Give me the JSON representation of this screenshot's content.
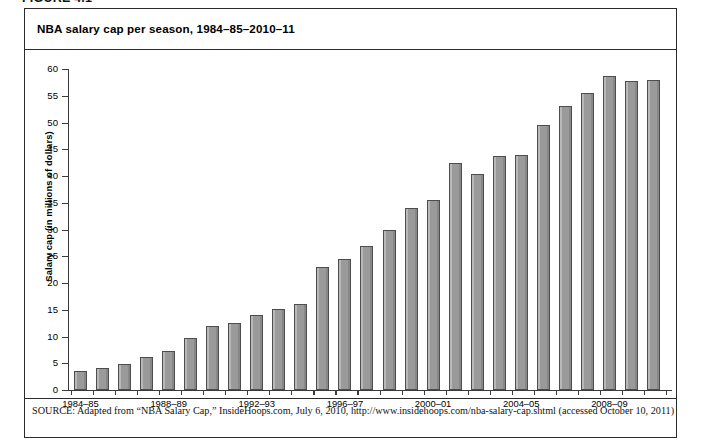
{
  "figure": {
    "label": "FIGURE 4.1"
  },
  "chart_title": "NBA salary cap per season, 1984–85–2010–11",
  "source": {
    "kicker": "SOURCE:",
    "text": " Adapted from “NBA Salary Cap,” InsideHoops.com, July 6, 2010, http://www.insidehoops.com/nba-salary-cap.shtml (accessed October 10, 2011)"
  },
  "chart_data": {
    "type": "bar",
    "title": "NBA salary cap per season, 1984–85–2010–11",
    "xlabel": "",
    "ylabel": "Salary cap (in millions of dollars)",
    "ylim": [
      0,
      60
    ],
    "ytick_step": 5,
    "yticks": [
      0,
      5,
      10,
      15,
      20,
      25,
      30,
      35,
      40,
      45,
      50,
      55,
      60
    ],
    "grid": false,
    "legend": false,
    "bar_color": "#919191",
    "bar_edge_color": "#4d4d4d",
    "categories": [
      "1984–85",
      "1985–86",
      "1986–87",
      "1987–88",
      "1988–89",
      "1989–90",
      "1990–91",
      "1991–92",
      "1992–93",
      "1993–94",
      "1994–95",
      "1995–96",
      "1996–97",
      "1997–98",
      "1998–99",
      "1999–00",
      "2000–01",
      "2001–02",
      "2002–03",
      "2003–04",
      "2004–05",
      "2005–06",
      "2006–07",
      "2007–08",
      "2008–09",
      "2009–10",
      "2010–11"
    ],
    "values": [
      3.6,
      4.2,
      4.9,
      6.2,
      7.2,
      9.8,
      11.9,
      12.5,
      14.0,
      15.2,
      16.0,
      23.0,
      24.4,
      26.9,
      30.0,
      34.0,
      35.5,
      42.5,
      40.3,
      43.8,
      43.9,
      49.5,
      53.1,
      55.6,
      58.7,
      57.7,
      58.0
    ],
    "xtick_labels": [
      "1984–85",
      "1988–89",
      "1992–93",
      "1996–97",
      "2000–01",
      "2004–05",
      "2008–09"
    ],
    "xtick_indices": [
      0,
      4,
      8,
      12,
      16,
      20,
      24
    ]
  }
}
